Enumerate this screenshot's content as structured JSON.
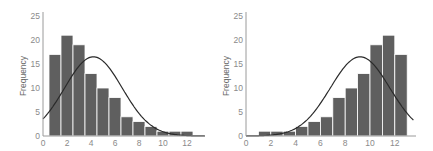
{
  "chart_data": [
    {
      "type": "bar",
      "title": "",
      "xlabel": "",
      "ylabel": "Frequency",
      "xlim": [
        0,
        13.5
      ],
      "ylim": [
        0,
        25
      ],
      "xticks": [
        0,
        2,
        4,
        6,
        8,
        10,
        12
      ],
      "yticks": [
        0,
        5,
        10,
        15,
        20,
        25
      ],
      "bin_centers": [
        1,
        2,
        3,
        4,
        5,
        6,
        7,
        8,
        9,
        10,
        11,
        12
      ],
      "values": [
        17,
        21,
        19,
        13,
        10,
        8,
        4,
        3,
        2,
        1,
        1,
        1
      ],
      "overlay": {
        "type": "normal_curve",
        "mean": 4.2,
        "peak": 16.5,
        "sd": 2.4
      },
      "grid": false,
      "legend": null,
      "description": "Right-skewed (positively skewed) histogram with fitted normal curve"
    },
    {
      "type": "bar",
      "title": "",
      "xlabel": "",
      "ylabel": "Frequency",
      "xlim": [
        0,
        13.5
      ],
      "ylim": [
        0,
        25
      ],
      "xticks": [
        0,
        2,
        4,
        6,
        8,
        10,
        12
      ],
      "yticks": [
        0,
        5,
        10,
        15,
        20,
        25
      ],
      "bin_centers": [
        1.5,
        2.5,
        3.5,
        4.5,
        5.5,
        6.5,
        7.5,
        8.5,
        9.5,
        10.5,
        11.5,
        12.5
      ],
      "values": [
        1,
        1,
        1,
        2,
        3,
        4,
        8,
        10,
        13,
        19,
        21,
        17
      ],
      "overlay": {
        "type": "normal_curve",
        "mean": 9.2,
        "peak": 16.5,
        "sd": 2.4
      },
      "grid": false,
      "legend": null,
      "description": "Left-skewed (negatively skewed) histogram with fitted normal curve"
    }
  ],
  "charts": [
    {
      "ylabel": "Frequency",
      "yticks": [
        "0",
        "5",
        "10",
        "15",
        "20",
        "25"
      ],
      "xticks": [
        "0",
        "2",
        "4",
        "6",
        "8",
        "10",
        "12"
      ]
    },
    {
      "ylabel": "Frequency",
      "yticks": [
        "0",
        "5",
        "10",
        "15",
        "20",
        "25"
      ],
      "xticks": [
        "0",
        "2",
        "4",
        "6",
        "8",
        "10",
        "12"
      ]
    }
  ]
}
